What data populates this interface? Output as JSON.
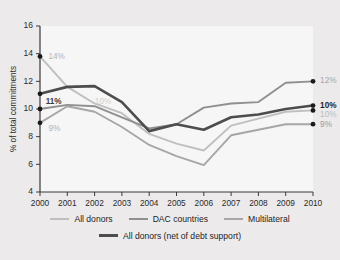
{
  "chart_data": {
    "type": "line",
    "title": "",
    "xlabel": "",
    "ylabel": "% of total commitments",
    "x": [
      2000,
      2001,
      2002,
      2003,
      2004,
      2005,
      2006,
      2007,
      2008,
      2009,
      2010
    ],
    "categories": [
      "2000",
      "2001",
      "2002",
      "2003",
      "2004",
      "2005",
      "2006",
      "2007",
      "2008",
      "2009",
      "2010"
    ],
    "xlim": [
      2000,
      2010
    ],
    "ylim": [
      4,
      16
    ],
    "yticks": [
      4,
      6,
      8,
      10,
      12,
      14,
      16
    ],
    "ytick_labels": [
      "4",
      "6",
      "8",
      "10",
      "12",
      "14",
      "16"
    ],
    "grid": false,
    "legend_position": "bottom",
    "series": [
      {
        "name": "All donors",
        "color": "#bfbfbf",
        "width": 1.9,
        "values": [
          13.8,
          11.6,
          10.4,
          9.7,
          8.2,
          7.5,
          7.0,
          8.8,
          9.3,
          9.8,
          9.9
        ]
      },
      {
        "name": "DAC countries",
        "color": "#8f8f8f",
        "width": 1.9,
        "values": [
          10.0,
          10.3,
          10.2,
          9.4,
          8.6,
          8.9,
          10.1,
          10.4,
          10.5,
          11.9,
          12.0
        ]
      },
      {
        "name": "Multilateral",
        "color": "#a6a6a6",
        "width": 1.9,
        "values": [
          9.0,
          10.2,
          9.8,
          8.7,
          7.4,
          6.6,
          5.95,
          8.1,
          8.5,
          8.9,
          8.9
        ]
      },
      {
        "name": "All donors (net of debt support)",
        "color": "#4d4d4d",
        "width": 2.6,
        "values": [
          11.1,
          11.6,
          11.65,
          10.5,
          8.4,
          8.9,
          8.5,
          9.4,
          9.6,
          10.0,
          10.25
        ]
      }
    ],
    "annotations": [
      {
        "text": "14%",
        "x": 2000.2,
        "y": 13.75,
        "color": "#b3b3b3",
        "bold": false,
        "anchor": "start"
      },
      {
        "text": "11%",
        "x": 2000.1,
        "y": 10.55,
        "color": "#3d3d3d",
        "bold": true,
        "anchor": "start"
      },
      {
        "text": "9%",
        "x": 2000.2,
        "y": 8.6,
        "color": "#b3b3b3",
        "bold": false,
        "anchor": "start"
      },
      {
        "text": "10%",
        "x": 2001.9,
        "y": 10.5,
        "color": "#cfcfcf",
        "bold": false,
        "anchor": "start"
      },
      {
        "text": "12%",
        "x": 2010.15,
        "y": 12.05,
        "color": "#a8a8a8",
        "bold": false,
        "anchor": "start"
      },
      {
        "text": "10%",
        "x": 2010.15,
        "y": 10.25,
        "color": "#1f1f1f",
        "bold": true,
        "anchor": "start"
      },
      {
        "text": "10%",
        "x": 2010.15,
        "y": 9.55,
        "color": "#bdbdbd",
        "bold": false,
        "anchor": "start"
      },
      {
        "text": "9%",
        "x": 2010.15,
        "y": 8.85,
        "color": "#9a9a9a",
        "bold": false,
        "anchor": "start"
      }
    ],
    "endpoint_markers": [
      {
        "x": 2000,
        "y": 13.8
      },
      {
        "x": 2000,
        "y": 11.1
      },
      {
        "x": 2000,
        "y": 10.0
      },
      {
        "x": 2000,
        "y": 9.0
      },
      {
        "x": 2010,
        "y": 12.0
      },
      {
        "x": 2010,
        "y": 10.25
      },
      {
        "x": 2010,
        "y": 9.9
      },
      {
        "x": 2010,
        "y": 8.9
      }
    ]
  },
  "legend": {
    "rows": [
      [
        {
          "label": "All donors",
          "color": "#bfbfbf",
          "width": 2,
          "bold": false
        },
        {
          "label": "DAC countries",
          "color": "#8f8f8f",
          "width": 2,
          "bold": false
        },
        {
          "label": "Multilateral",
          "color": "#a6a6a6",
          "width": 2,
          "bold": false
        }
      ],
      [
        {
          "label": "All donors (net of debt support)",
          "color": "#4d4d4d",
          "width": 3,
          "bold": false
        }
      ]
    ]
  }
}
